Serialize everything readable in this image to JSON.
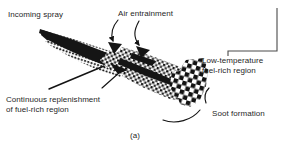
{
  "figure": {
    "caption": "(a)",
    "colors": {
      "ink": "#1a1a1a",
      "paper": "#ffffff",
      "rule": "#4a4a4a"
    },
    "labels": {
      "incoming_spray": "Incoming spray",
      "air_entrainment": "Air entrainment",
      "low_temperature_line1": "Low-temperature",
      "low_temperature_line2": "fuel-rich region",
      "continuous_line1": "Continuous replenishment",
      "continuous_line2": "of fuel-rich region",
      "soot_formation": "Soot formation"
    },
    "regions": [
      {
        "name": "dense-core",
        "pattern": "solid-black",
        "position": "upstream"
      },
      {
        "name": "fuel-rich-zone",
        "pattern": "stipple-dots",
        "position": "midstream"
      },
      {
        "name": "soot-zone",
        "pattern": "checkerboard",
        "position": "downstream-tip"
      }
    ],
    "leaders": [
      {
        "name": "air-entrainment-left",
        "type": "curved-arrow"
      },
      {
        "name": "air-entrainment-right",
        "type": "curved-arrow"
      },
      {
        "name": "continuous-replenishment",
        "type": "straight-arrow"
      },
      {
        "name": "low-temperature-bracket",
        "type": "corner-bracket"
      },
      {
        "name": "soot-formation-upper",
        "type": "curve"
      },
      {
        "name": "soot-formation-lower",
        "type": "curve"
      }
    ]
  }
}
